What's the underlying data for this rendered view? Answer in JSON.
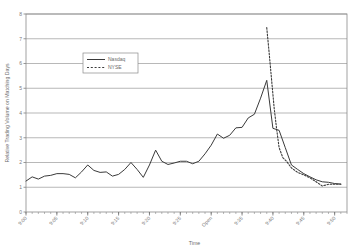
{
  "chart_data": {
    "type": "line",
    "title": "",
    "xlabel": "Time",
    "ylabel": "Relative Trading Volume on Matching Days",
    "ylim": [
      0,
      8
    ],
    "yticks": [
      0,
      1,
      2,
      3,
      4,
      5,
      6,
      7,
      8
    ],
    "ytick_labels": [
      "0",
      "1",
      "2",
      "3",
      "4",
      "5",
      "6",
      "7",
      "8"
    ],
    "grid": true,
    "grid_axis": "y",
    "legend_position": "upper-left-inset",
    "xtick_labels": [
      "9:00",
      "9:05",
      "9:10",
      "9:15",
      "9:20",
      "9:25",
      "Open",
      "9:35",
      "9:40",
      "9:45",
      "9:50"
    ],
    "xtick_positions": [
      0,
      5,
      10,
      15,
      20,
      25,
      30,
      35,
      40,
      45,
      50
    ],
    "xlim": [
      0,
      52
    ],
    "minor_tick_interval": 1,
    "series": [
      {
        "name": "Nasdaq",
        "style": "solid",
        "color": "#3a3a3a",
        "x": [
          0,
          1,
          2,
          3,
          4,
          5,
          6,
          7,
          8,
          9,
          10,
          11,
          12,
          13,
          14,
          15,
          16,
          17,
          18,
          19,
          20,
          21,
          22,
          23,
          24,
          25,
          26,
          27,
          28,
          29,
          30,
          31,
          32,
          33,
          34,
          35,
          36,
          37,
          38,
          39,
          40,
          41,
          42,
          43,
          44,
          45,
          46,
          47,
          48,
          49,
          50,
          51
        ],
        "values": [
          1.25,
          1.42,
          1.33,
          1.45,
          1.48,
          1.55,
          1.55,
          1.52,
          1.38,
          1.62,
          1.9,
          1.68,
          1.6,
          1.62,
          1.45,
          1.52,
          1.72,
          2.0,
          1.72,
          1.4,
          1.9,
          2.5,
          2.05,
          1.92,
          1.98,
          2.05,
          2.05,
          1.95,
          2.05,
          2.35,
          2.7,
          3.15,
          2.98,
          3.1,
          3.4,
          3.42,
          3.8,
          3.95,
          4.6,
          5.32,
          3.38,
          3.3,
          2.6,
          1.9,
          1.72,
          1.55,
          1.42,
          1.3,
          1.22,
          1.2,
          1.15,
          1.13
        ]
      },
      {
        "name": "NYSE",
        "style": "dashed",
        "color": "#3a3a3a",
        "x": [
          39,
          39.4,
          39.8,
          40.2,
          40.6,
          41,
          41.6,
          42.2,
          43,
          44,
          45,
          46,
          47,
          48,
          49,
          50,
          51
        ],
        "values": [
          7.45,
          6.4,
          5.3,
          4.2,
          3.35,
          2.6,
          2.2,
          2.05,
          1.78,
          1.6,
          1.5,
          1.38,
          1.22,
          1.05,
          1.12,
          1.12,
          1.12
        ]
      }
    ]
  },
  "legend": {
    "items": [
      {
        "label": "Nasdaq",
        "style": "solid"
      },
      {
        "label": "NYSE",
        "style": "dashed"
      }
    ]
  }
}
